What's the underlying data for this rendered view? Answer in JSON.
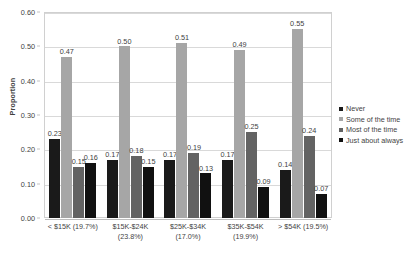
{
  "chart_data": {
    "type": "bar",
    "title": "",
    "xlabel": "",
    "ylabel": "Proportion",
    "ylim": [
      0.0,
      0.6
    ],
    "yticks": [
      "0.00",
      "0.10",
      "0.20",
      "0.30",
      "0.40",
      "0.50",
      "0.60"
    ],
    "grid": true,
    "legend_position": "right",
    "categories": [
      "< $15K (19.7%)",
      "$15K-$24K (23.8%)",
      "$25K-$34K (17.0%)",
      "$35K-$54K (19.9%)",
      "> $54K (19.5%)"
    ],
    "series": [
      {
        "name": "Never",
        "color": "#1a1a1a",
        "values": [
          0.23,
          0.17,
          0.17,
          0.17,
          0.14
        ],
        "labels": [
          "0.23",
          "0.17",
          "0.17",
          "0.17",
          "0.14"
        ]
      },
      {
        "name": "Some of the time",
        "color": "#a6a6a6",
        "values": [
          0.47,
          0.5,
          0.51,
          0.49,
          0.55
        ],
        "labels": [
          "0.47",
          "0.50",
          "0.51",
          "0.49",
          "0.55"
        ]
      },
      {
        "name": "Most of the time",
        "color": "#636363",
        "values": [
          0.15,
          0.18,
          0.19,
          0.25,
          0.24
        ],
        "labels": [
          "0.15",
          "0.18",
          "0.19",
          "0.25",
          "0.24"
        ]
      },
      {
        "name": "Just about always",
        "color": "#111111",
        "values": [
          0.16,
          0.15,
          0.13,
          0.09,
          0.07
        ],
        "labels": [
          "0.16",
          "0.15",
          "0.13",
          "0.09",
          "0.07"
        ]
      }
    ]
  }
}
